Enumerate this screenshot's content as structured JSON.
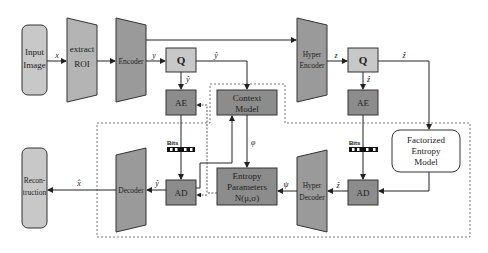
{
  "diagram": {
    "nodes": {
      "input_image": {
        "line1": "Input",
        "line2": "Image"
      },
      "extract_roi": {
        "line1": "extract",
        "line2": "ROI"
      },
      "encoder": {
        "label": "Encoder"
      },
      "quantizer_main": {
        "label": "Q"
      },
      "ae_main": {
        "label": "AE"
      },
      "context_model": {
        "line1": "Context",
        "line2": "Model"
      },
      "hyper_encoder": {
        "line1": "Hyper",
        "line2": "Encoder"
      },
      "quantizer_hyper": {
        "label": "Q"
      },
      "ae_hyper": {
        "label": "AE"
      },
      "factorized_entropy_model": {
        "line1": "Factorized",
        "line2": "Entropy",
        "line3": "Model"
      },
      "ad_hyper": {
        "label": "AD"
      },
      "hyper_decoder": {
        "line1": "Hyper",
        "line2": "Decoder"
      },
      "entropy_parameters": {
        "line1": "Entropy",
        "line2": "Parameters",
        "line3": "N(μ,σ)"
      },
      "ad_main": {
        "label": "AD"
      },
      "decoder": {
        "label": "Decoder"
      },
      "reconstruction": {
        "line1": "Recon-",
        "line2": "truction"
      }
    },
    "edge_labels": {
      "x": "x",
      "y": "y",
      "y_hat_top": "ŷ",
      "y_hat_ae": "ŷ",
      "z": "z",
      "z_hat_right": "ẑ",
      "z_hat_ae": "ẑ",
      "z_hat_ad": "ẑ",
      "phi": "φ",
      "psi": "ψ",
      "y_hat_ad": "ŷ",
      "x_hat": "x̂"
    },
    "bits_labels": {
      "main": "Bits",
      "hyper": "Bits"
    },
    "colors": {
      "light_box": "#c8c8c8",
      "dark_box": "#8c8c8c",
      "trapezoid": "#a0a0a0",
      "stroke": "#333333"
    }
  }
}
